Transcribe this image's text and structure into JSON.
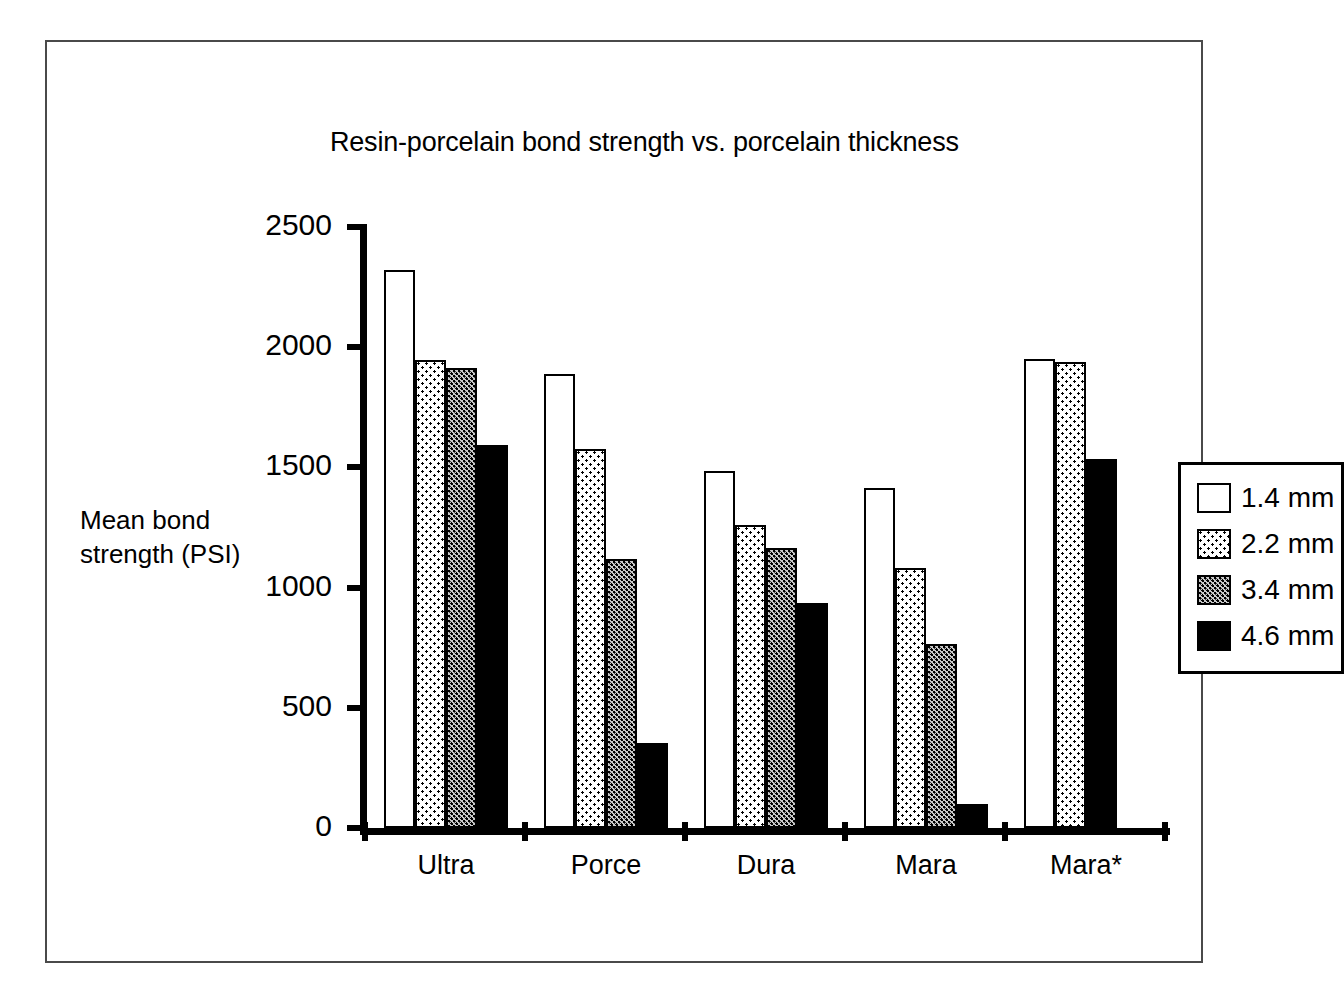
{
  "chart_data": {
    "type": "bar",
    "title": "Resin-porcelain bond strength vs. porcelain thickness",
    "xlabel": "",
    "ylabel": "Mean bond strength (PSI)",
    "ylabel_lines": [
      "Mean bond",
      "strength (PSI)"
    ],
    "categories": [
      "Ultra",
      "Porce",
      "Dura",
      "Mara",
      "Mara*"
    ],
    "ylim": [
      0,
      2500
    ],
    "yticks": [
      0,
      500,
      1000,
      1500,
      2000,
      2500
    ],
    "ytick_labels": [
      "0",
      "500",
      "1000",
      "1500",
      "2000",
      "2500"
    ],
    "grid": false,
    "legend_position": "upper right inside plot",
    "series": [
      {
        "name": "1.4 mm",
        "fill": "open",
        "values": [
          2320,
          1890,
          1485,
          1415,
          1950
        ]
      },
      {
        "name": "2.2 mm",
        "fill": "light-dot",
        "values": [
          1945,
          1575,
          1260,
          1080,
          1940
        ]
      },
      {
        "name": "3.4 mm",
        "fill": "dense-dot",
        "values": [
          1915,
          1120,
          1165,
          765,
          null
        ]
      },
      {
        "name": "4.6 mm",
        "fill": "solid",
        "values": [
          1595,
          355,
          935,
          100,
          1535
        ]
      }
    ]
  },
  "legend": {
    "items": [
      {
        "label": "1.4 mm",
        "fill": "open"
      },
      {
        "label": "2.2 mm",
        "fill": "light-dot"
      },
      {
        "label": "3.4 mm",
        "fill": "dense-dot"
      },
      {
        "label": "4.6 mm",
        "fill": "solid"
      }
    ]
  },
  "colors": {
    "axis": "#000000",
    "frame": "#4a4a4a",
    "background": "#ffffff",
    "solid_fill": "#000000",
    "dense_dot_base": "#c9c9c9"
  }
}
